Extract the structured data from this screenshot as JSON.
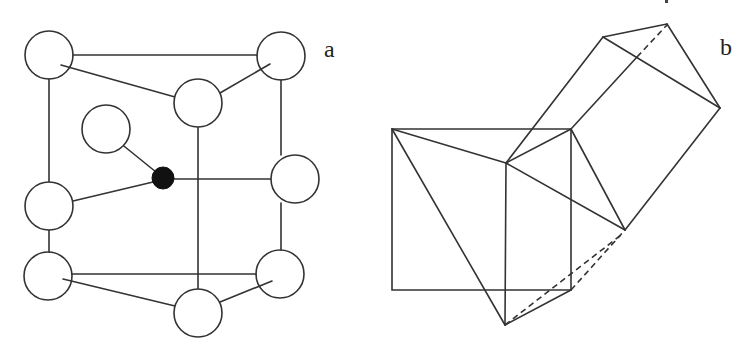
{
  "panels": [
    {
      "id": "a",
      "label": "a",
      "description": "Crystal unit cell with atoms",
      "atoms": [
        {
          "role": "corner",
          "style": "open",
          "cx": 49,
          "cy": 55,
          "r": 24
        },
        {
          "role": "corner",
          "style": "open",
          "cx": 281,
          "cy": 56,
          "r": 24
        },
        {
          "role": "corner",
          "style": "open",
          "cx": 198,
          "cy": 103,
          "r": 24
        },
        {
          "role": "face",
          "style": "hatched",
          "cx": 106,
          "cy": 129,
          "r": 24
        },
        {
          "role": "center",
          "style": "filled",
          "cx": 163,
          "cy": 178,
          "r": 11
        },
        {
          "role": "face",
          "style": "hatched",
          "cx": 49,
          "cy": 206,
          "r": 24
        },
        {
          "role": "face",
          "style": "hatched",
          "cx": 295,
          "cy": 179,
          "r": 24
        },
        {
          "role": "corner",
          "style": "open",
          "cx": 48,
          "cy": 276,
          "r": 24
        },
        {
          "role": "corner",
          "style": "open",
          "cx": 280,
          "cy": 274,
          "r": 24
        },
        {
          "role": "corner",
          "style": "open",
          "cx": 198,
          "cy": 313,
          "r": 24
        }
      ]
    },
    {
      "id": "b",
      "label": "b",
      "description": "Polyhedra projection"
    }
  ],
  "colors": {
    "stroke": "#333333",
    "background": "#ffffff",
    "filled_atom": "#111111"
  }
}
